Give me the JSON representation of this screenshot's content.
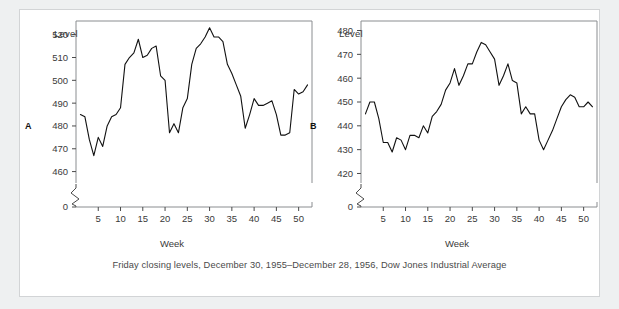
{
  "figure": {
    "caption": "Friday closing levels, December 30, 1955–December 28, 1956, Dow Jones Industrial Average",
    "frame_color": "#d2d4d6",
    "background": "#eef0f1",
    "line_color": "#111111"
  },
  "panels": {
    "a": {
      "letter": "A",
      "ylabel": "Level",
      "xlabel": "Week"
    },
    "b": {
      "letter": "B",
      "ylabel": "Level",
      "xlabel": "Week"
    }
  },
  "chart_data": [
    {
      "type": "line",
      "id": "A",
      "title": "",
      "xlabel": "Week",
      "ylabel": "Level",
      "xlim": [
        0,
        53
      ],
      "ylim": [
        455,
        526
      ],
      "yticks": [
        460,
        470,
        480,
        490,
        500,
        510,
        520
      ],
      "ytick_extra": "0",
      "axis_break": true,
      "xticks": [
        5,
        10,
        15,
        20,
        25,
        30,
        35,
        40,
        45,
        50
      ],
      "grid": false,
      "legend": null,
      "x": [
        1,
        2,
        3,
        4,
        5,
        6,
        7,
        8,
        9,
        10,
        11,
        12,
        13,
        14,
        15,
        16,
        17,
        18,
        19,
        20,
        21,
        22,
        23,
        24,
        25,
        26,
        27,
        28,
        29,
        30,
        31,
        32,
        33,
        34,
        35,
        36,
        37,
        38,
        39,
        40,
        41,
        42,
        43,
        44,
        45,
        46,
        47,
        48,
        49,
        50,
        51,
        52
      ],
      "values": [
        485,
        484,
        474,
        467,
        475,
        471,
        480,
        484,
        485,
        488,
        507,
        510,
        512,
        518,
        510,
        511,
        514,
        515,
        502,
        500,
        477,
        481,
        477,
        488,
        492,
        507,
        514,
        516,
        519,
        523,
        519,
        519,
        517,
        507,
        503,
        498,
        493,
        479,
        485,
        492,
        489,
        489,
        490,
        491,
        485,
        476,
        476,
        477,
        496,
        494,
        495,
        498
      ]
    },
    {
      "type": "line",
      "id": "B",
      "title": "",
      "xlabel": "Week",
      "ylabel": "Level",
      "xlim": [
        0,
        53
      ],
      "ylim": [
        416,
        484
      ],
      "yticks": [
        420,
        430,
        440,
        450,
        460,
        470,
        480
      ],
      "ytick_extra": "0",
      "axis_break": true,
      "xticks": [
        5,
        10,
        15,
        20,
        25,
        30,
        35,
        40,
        45,
        50
      ],
      "grid": false,
      "legend": null,
      "x": [
        1,
        2,
        3,
        4,
        5,
        6,
        7,
        8,
        9,
        10,
        11,
        12,
        13,
        14,
        15,
        16,
        17,
        18,
        19,
        20,
        21,
        22,
        23,
        24,
        25,
        26,
        27,
        28,
        29,
        30,
        31,
        32,
        33,
        34,
        35,
        36,
        37,
        38,
        39,
        40,
        41,
        42,
        43,
        44,
        45,
        46,
        47,
        48,
        49,
        50,
        51,
        52
      ],
      "values": [
        445,
        450,
        450,
        443,
        433,
        433,
        429,
        435,
        434,
        430,
        436,
        436,
        435,
        440,
        437,
        444,
        446,
        449,
        455,
        458,
        464,
        457,
        461,
        466,
        466,
        471,
        475,
        474,
        471,
        468,
        457,
        461,
        466,
        459,
        458,
        445,
        448,
        445,
        445,
        434,
        430,
        434,
        438,
        443,
        448,
        451,
        453,
        452,
        448,
        448,
        450,
        448
      ]
    }
  ]
}
